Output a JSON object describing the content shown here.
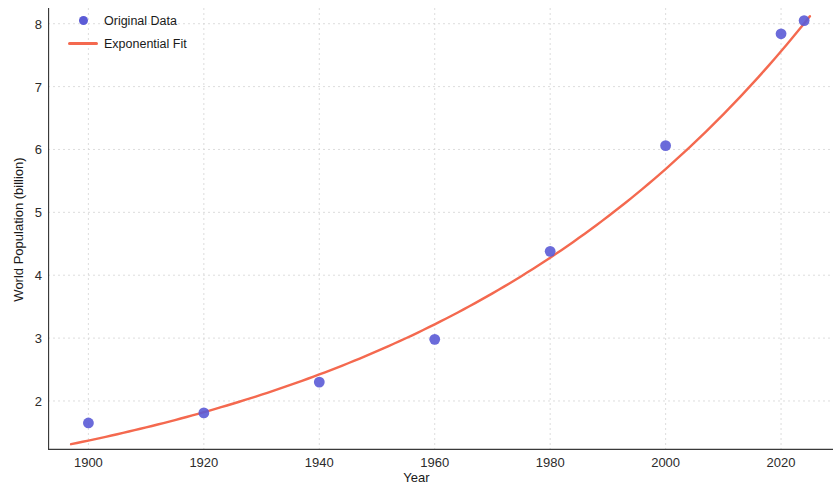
{
  "chart_data": {
    "type": "scatter",
    "title": "",
    "xlabel": "Year",
    "ylabel": "World Population (billion)",
    "xlim": [
      1893,
      2029
    ],
    "ylim": [
      1.22,
      8.25
    ],
    "xticks": [
      1900,
      1920,
      1940,
      1960,
      1980,
      2000,
      2020
    ],
    "yticks": [
      2,
      3,
      4,
      5,
      6,
      7,
      8
    ],
    "grid": true,
    "legend_position": "upper left",
    "series": [
      {
        "name": "Original Data",
        "type": "scatter",
        "color": "#5b5bd6",
        "x": [
          1900,
          1920,
          1940,
          1960,
          1980,
          2000,
          2020,
          2024
        ],
        "values": [
          1.65,
          1.81,
          2.3,
          2.98,
          4.38,
          6.06,
          7.84,
          8.05
        ]
      },
      {
        "name": "Exponential Fit",
        "type": "line",
        "color": "#f4694f",
        "x": [
          1900,
          1910,
          1920,
          1930,
          1940,
          1950,
          1960,
          1970,
          1980,
          1990,
          2000,
          2010,
          2020,
          2025
        ],
        "values": [
          1.37,
          1.53,
          1.72,
          1.93,
          2.17,
          2.44,
          2.74,
          3.08,
          3.46,
          3.89,
          4.37,
          4.91,
          5.52,
          5.85
        ]
      }
    ]
  },
  "legend": {
    "entries": [
      {
        "label": "Original Data",
        "marker": "dot",
        "color": "#5b5bd6"
      },
      {
        "label": "Exponential Fit",
        "marker": "line",
        "color": "#f4694f"
      }
    ]
  },
  "axes": {
    "x_label": "Year",
    "y_label": "World Population (billion)",
    "x_tick_labels": [
      "1900",
      "1920",
      "1940",
      "1960",
      "1980",
      "2000",
      "2020"
    ],
    "y_tick_labels": [
      "2",
      "3",
      "4",
      "5",
      "6",
      "7",
      "8"
    ]
  },
  "colors": {
    "marker": "#5b5bd6",
    "fit_line": "#f4694f",
    "grid": "#d8d8d8",
    "axis": "#3a3a3a",
    "background": "#ffffff"
  }
}
